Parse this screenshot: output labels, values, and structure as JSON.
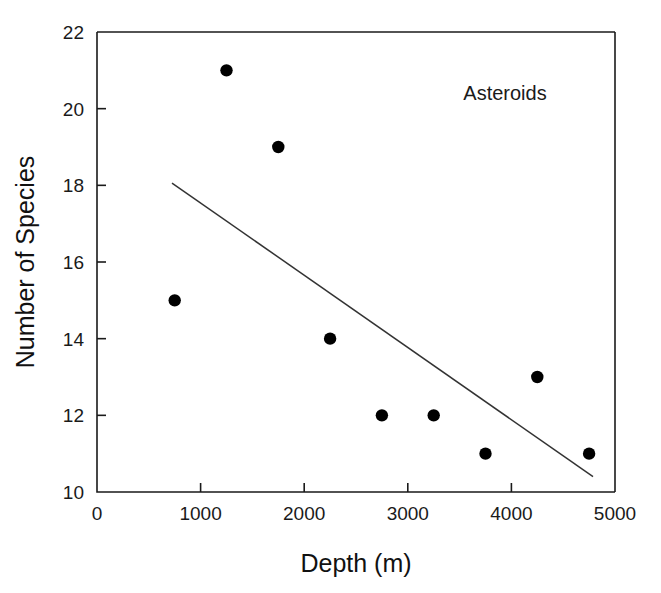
{
  "chart_data": {
    "type": "scatter",
    "title": "",
    "annotation": "Asteroids",
    "xlabel": "Depth (m)",
    "ylabel": "Number of Species",
    "xlim": [
      0,
      5000
    ],
    "ylim": [
      10,
      22
    ],
    "xticks": [
      0,
      1000,
      2000,
      3000,
      4000,
      5000
    ],
    "yticks": [
      10,
      12,
      14,
      16,
      18,
      20,
      22
    ],
    "xtick_labels": [
      "0",
      "1000",
      "2000",
      "3000",
      "4000",
      "5000"
    ],
    "ytick_labels": [
      "10",
      "12",
      "14",
      "16",
      "18",
      "20",
      "22"
    ],
    "grid": false,
    "legend": "none",
    "series": [
      {
        "name": "Asteroids",
        "marker": "filled-circle",
        "color": "#000000",
        "x": [
          750,
          1250,
          1750,
          2250,
          2750,
          3250,
          3750,
          4250,
          4750
        ],
        "y": [
          15,
          21,
          19,
          14,
          12,
          12,
          11,
          13,
          11
        ]
      }
    ],
    "trendline": {
      "type": "linear-regression",
      "color": "#333333",
      "x_start": 724,
      "y_start": 18.06,
      "x_end": 4788,
      "y_end": 10.4
    }
  },
  "figure": {
    "annotation_label": "Asteroids",
    "x_axis_title": "Depth (m)",
    "y_axis_title": "Number of Species"
  }
}
